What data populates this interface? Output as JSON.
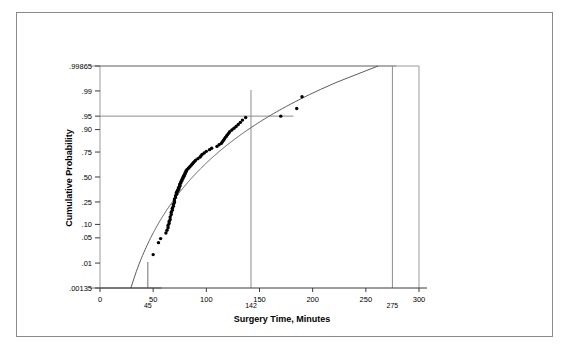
{
  "figure": {
    "name": "normal-probability-plot",
    "border_color": "#8a8a8a",
    "background": "#ffffff"
  },
  "chart_data": {
    "type": "scatter",
    "title": "",
    "subtitle": "",
    "xlabel": "Surgery Time, Minutes",
    "ylabel": "Cumulative Probability",
    "xlim": [
      0,
      300
    ],
    "ylim_probability": [
      0.00135,
      0.99865
    ],
    "grid": false,
    "legend": "none",
    "x_ticks": [
      0,
      50,
      100,
      150,
      200,
      250,
      300
    ],
    "x_tick_labels": [
      "0",
      "50",
      "100",
      "150",
      "200",
      "250",
      "300"
    ],
    "x_extra_ticks": [
      45,
      142,
      275
    ],
    "x_extra_tick_labels": [
      "45",
      "142",
      "275"
    ],
    "y_ticks": [
      0.00135,
      0.01,
      0.05,
      0.1,
      0.25,
      0.5,
      0.75,
      0.9,
      0.95,
      0.99,
      0.99865
    ],
    "y_tick_labels": [
      ".00135",
      ".01",
      ".05",
      ".10",
      ".25",
      ".50",
      ".75",
      ".90",
      ".95",
      ".99",
      ".99865"
    ],
    "reference_lines": [
      {
        "name": "lower-reference",
        "probability": 0.00135,
        "x_value": 45,
        "orientation": "horizontal-with-drop"
      },
      {
        "name": "mid-reference",
        "probability": 0.95,
        "x_value": 142,
        "orientation": "horizontal-with-drop"
      },
      {
        "name": "upper-reference",
        "probability": 0.99865,
        "x_value": 275,
        "orientation": "horizontal-with-drop"
      }
    ],
    "fit_line": {
      "name": "lognormal-fit",
      "description": "fitted lognormal cumulative distribution curve",
      "anchor_points": [
        {
          "x": 45,
          "p": 0.00135
        },
        {
          "x": 142,
          "p": 0.95
        },
        {
          "x": 275,
          "p": 0.99865
        }
      ],
      "distribution": "lognormal",
      "log_mean": 4.4669,
      "log_sd": 0.3665
    },
    "series": [
      {
        "name": "Surgery times",
        "marker": "filled-circle",
        "color": "#000000",
        "points_x": [
          50,
          55,
          57,
          62,
          63,
          64,
          64,
          65,
          65,
          66,
          66,
          67,
          67,
          68,
          68,
          69,
          69,
          70,
          70,
          70,
          71,
          71,
          72,
          72,
          72,
          73,
          73,
          74,
          74,
          74,
          75,
          75,
          75,
          76,
          76,
          77,
          77,
          78,
          78,
          79,
          79,
          80,
          80,
          81,
          81,
          82,
          83,
          84,
          85,
          86,
          87,
          88,
          89,
          90,
          92,
          94,
          95,
          96,
          98,
          100,
          103,
          105,
          110,
          112,
          114,
          115,
          116,
          117,
          118,
          119,
          120,
          121,
          122,
          124,
          126,
          128,
          130,
          132,
          134,
          137,
          170,
          185,
          190
        ],
        "points_p": [
          0.018,
          0.038,
          0.048,
          0.065,
          0.075,
          0.085,
          0.095,
          0.105,
          0.115,
          0.125,
          0.14,
          0.155,
          0.17,
          0.185,
          0.2,
          0.215,
          0.23,
          0.245,
          0.26,
          0.275,
          0.29,
          0.305,
          0.32,
          0.33,
          0.34,
          0.35,
          0.36,
          0.37,
          0.38,
          0.39,
          0.4,
          0.412,
          0.424,
          0.436,
          0.448,
          0.46,
          0.472,
          0.484,
          0.496,
          0.508,
          0.52,
          0.532,
          0.544,
          0.556,
          0.568,
          0.58,
          0.592,
          0.604,
          0.616,
          0.628,
          0.64,
          0.652,
          0.664,
          0.676,
          0.69,
          0.704,
          0.716,
          0.728,
          0.742,
          0.756,
          0.77,
          0.782,
          0.796,
          0.808,
          0.818,
          0.828,
          0.838,
          0.848,
          0.858,
          0.866,
          0.874,
          0.882,
          0.89,
          0.898,
          0.906,
          0.914,
          0.922,
          0.93,
          0.938,
          0.946,
          0.95,
          0.968,
          0.985
        ]
      }
    ],
    "annotations": [
      {
        "name": "lower-spec-annotation",
        "text": "45",
        "x": 45,
        "p": 0.00135
      },
      {
        "name": "percentile-95-annotation",
        "text": "142",
        "x": 142,
        "p": 0.95
      },
      {
        "name": "upper-tail-annotation",
        "text": "275",
        "x": 275,
        "p": 0.99865
      }
    ]
  }
}
